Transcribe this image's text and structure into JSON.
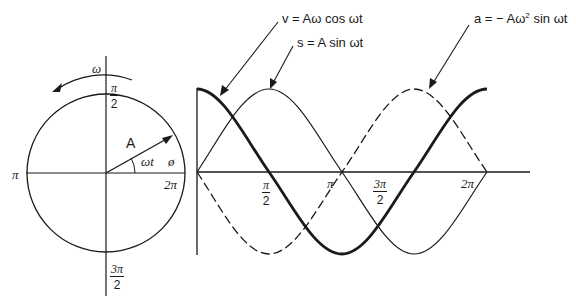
{
  "circle": {
    "omega_label": "ω",
    "radius_label": "A",
    "angle_label": "ωt",
    "phase_label": "ø",
    "axis_labels": {
      "top": {
        "num": "π",
        "den": "2"
      },
      "left": "π",
      "right": "2π",
      "bottom": {
        "num": "3π",
        "den": "2"
      }
    }
  },
  "graph": {
    "x_ticks": [
      {
        "num": "π",
        "den": "2"
      },
      {
        "label": "π"
      },
      {
        "num": "3π",
        "den": "2"
      },
      {
        "label": "2π"
      }
    ],
    "curves": [
      {
        "name": "displacement",
        "label": "s = A sin ωt",
        "style": "thin solid"
      },
      {
        "name": "velocity",
        "label": "v = Aω cos ωt",
        "style": "thick solid"
      },
      {
        "name": "acceleration",
        "label": "a = − Aω² sin ωt",
        "style": "dashed"
      }
    ]
  },
  "labels": {
    "velocity": "v = Aω cos ωt",
    "displacement": "s = A sin ωt",
    "acceleration_prefix": "a = − Aω",
    "acceleration_sup": "2",
    "acceleration_suffix": " sin ωt"
  }
}
